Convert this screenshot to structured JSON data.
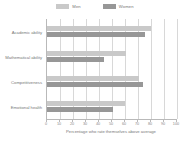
{
  "chart_data": {
    "type": "bar",
    "orientation": "horizontal",
    "title": "",
    "xlabel": "Percentage who rate themselves above average",
    "ylabel": "",
    "xlim": [
      0,
      100
    ],
    "xticks": [
      0,
      10,
      20,
      30,
      40,
      50,
      60,
      70,
      80,
      90,
      100
    ],
    "grid": true,
    "legend_position": "top-center",
    "categories": [
      "Academic ability",
      "Mathematical ability",
      "Competitiveness",
      "Emotional health"
    ],
    "series": [
      {
        "name": "Men",
        "color": "#c9c9c9",
        "values": [
          80,
          61,
          71,
          60
        ]
      },
      {
        "name": "Women",
        "color": "#979797",
        "values": [
          75,
          44,
          74,
          51
        ]
      }
    ]
  },
  "legend": {
    "items": [
      {
        "label": "Men",
        "color": "#c9c9c9"
      },
      {
        "label": "Women",
        "color": "#979797"
      }
    ]
  },
  "axis": {
    "x_title": "Percentage who rate themselves above average",
    "tick_labels": [
      "0",
      "10",
      "20",
      "30",
      "40",
      "50",
      "60",
      "70",
      "80",
      "90",
      "100"
    ]
  }
}
